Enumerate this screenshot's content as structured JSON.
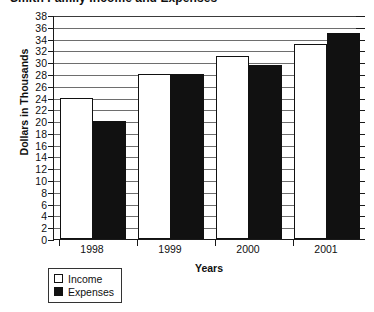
{
  "chart_data": {
    "type": "bar",
    "title": "Smith Family Income and Expenses",
    "xlabel": "Years",
    "ylabel": "Dollars in Thousands",
    "categories": [
      "1998",
      "1999",
      "2000",
      "2001"
    ],
    "series": [
      {
        "name": "Income",
        "values": [
          24,
          28,
          31,
          33
        ],
        "color": "#ffffff"
      },
      {
        "name": "Expenses",
        "values": [
          20,
          28,
          29.5,
          35
        ],
        "color": "#111111"
      }
    ],
    "ylim": [
      0,
      38
    ],
    "ytick_step": 2,
    "yticks": [
      38,
      36,
      34,
      32,
      30,
      28,
      26,
      24,
      22,
      20,
      18,
      16,
      14,
      12,
      10,
      8,
      6,
      4,
      2,
      0
    ],
    "grid": true,
    "grid_axis": "y",
    "legend_position": "below-left",
    "legend": [
      {
        "label": "Income",
        "swatch": "white-square"
      },
      {
        "label": "Expenses",
        "swatch": "black-square"
      }
    ]
  }
}
